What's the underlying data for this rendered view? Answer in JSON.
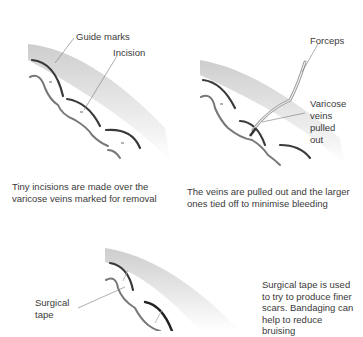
{
  "panels": [
    {
      "id": "step-1",
      "labels": {
        "guide_marks": "Guide marks",
        "incision": "Incision"
      },
      "caption_line1": "Tiny incisions are made over the",
      "caption_line2": "varicose veins marked for removal"
    },
    {
      "id": "step-2",
      "labels": {
        "forceps": "Forceps",
        "varicose_line1": "Varicose",
        "varicose_line2": "veins",
        "varicose_line3": "pulled",
        "varicose_line4": "out"
      },
      "caption_line1": "The veins are pulled out and the larger",
      "caption_line2": "ones tied off to minimise bleeding"
    },
    {
      "id": "step-3",
      "labels": {
        "surgical_line1": "Surgical",
        "surgical_line2": "tape"
      },
      "caption_lines": [
        "Surgical tape is used",
        "to try to produce finer",
        "scars. Bandaging can",
        "help to reduce",
        "bruising"
      ]
    }
  ],
  "colors": {
    "skin_shadow": "#d0d0d0",
    "guide_mark": "#3a3a3a",
    "vein_outline": "#6a6a6a",
    "leader_line": "#777777",
    "text": "#3a3a3a"
  }
}
